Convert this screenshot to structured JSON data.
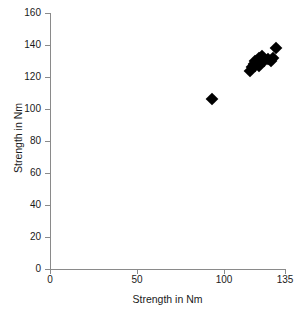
{
  "chart_data": {
    "type": "scatter",
    "title": "",
    "xlabel": "Strength in Nm",
    "ylabel": "Strength in Nm",
    "xlim": [
      0,
      135
    ],
    "ylim": [
      0,
      160
    ],
    "xticks": [
      0,
      50,
      100,
      135
    ],
    "yticks": [
      0,
      20,
      40,
      60,
      80,
      100,
      120,
      140,
      160
    ],
    "xtick_labels": [
      "0",
      "50",
      "100",
      "135"
    ],
    "ytick_labels": [
      "0",
      "20",
      "40",
      "60",
      "80",
      "100",
      "120",
      "140",
      "160"
    ],
    "grid": false,
    "legend": null,
    "marker": "diamond",
    "marker_color": "#000000",
    "points": [
      {
        "x": 93,
        "y": 106
      },
      {
        "x": 115,
        "y": 124
      },
      {
        "x": 116,
        "y": 126
      },
      {
        "x": 117,
        "y": 128
      },
      {
        "x": 118,
        "y": 127
      },
      {
        "x": 118,
        "y": 130
      },
      {
        "x": 119,
        "y": 129
      },
      {
        "x": 120,
        "y": 132
      },
      {
        "x": 120,
        "y": 127
      },
      {
        "x": 121,
        "y": 131
      },
      {
        "x": 122,
        "y": 133
      },
      {
        "x": 123,
        "y": 130
      },
      {
        "x": 125,
        "y": 131
      },
      {
        "x": 127,
        "y": 130
      },
      {
        "x": 128,
        "y": 132
      },
      {
        "x": 130,
        "y": 138
      }
    ]
  },
  "axes": {
    "x_title": "Strength in Nm",
    "y_title": "Strength in Nm",
    "x_ticks": [
      {
        "value": 0,
        "label": "0"
      },
      {
        "value": 50,
        "label": "50"
      },
      {
        "value": 100,
        "label": "100"
      },
      {
        "value": 135,
        "label": "135"
      }
    ],
    "y_ticks": [
      {
        "value": 0,
        "label": "0"
      },
      {
        "value": 20,
        "label": "20"
      },
      {
        "value": 40,
        "label": "40"
      },
      {
        "value": 60,
        "label": "60"
      },
      {
        "value": 80,
        "label": "80"
      },
      {
        "value": 100,
        "label": "100"
      },
      {
        "value": 120,
        "label": "120"
      },
      {
        "value": 140,
        "label": "140"
      },
      {
        "value": 160,
        "label": "160"
      }
    ]
  },
  "colors": {
    "axis": "#8a8a8a",
    "marker": "#000000",
    "text": "#1a1a1a",
    "background": "#ffffff"
  }
}
